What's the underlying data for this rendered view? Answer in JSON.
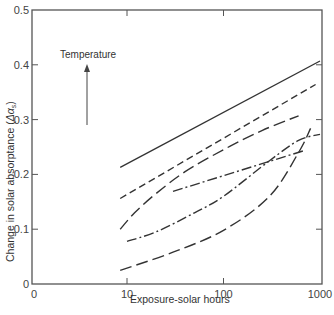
{
  "chart_data": {
    "type": "line",
    "title": "",
    "xlabel": "Exposure-solar hours",
    "ylabel": "Change in solar absorptance (Δαs)",
    "ylabel_main": "Change in solar absorptance (",
    "ylabel_symbol": "Δα",
    "ylabel_sub": "s",
    "ylabel_close": ")",
    "x_scale": "log",
    "xlim": [
      0,
      1000
    ],
    "ylim": [
      0,
      0.5
    ],
    "x_ticks": [
      {
        "value": 0,
        "label": "0"
      },
      {
        "value": 10,
        "label": "10"
      },
      {
        "value": 100,
        "label": "100"
      },
      {
        "value": 1000,
        "label": "1000"
      }
    ],
    "y_ticks": [
      {
        "value": 0,
        "label": "0"
      },
      {
        "value": 0.1,
        "label": "0.1"
      },
      {
        "value": 0.2,
        "label": "0.2"
      },
      {
        "value": 0.3,
        "label": "0.3"
      },
      {
        "value": 0.4,
        "label": "0.4"
      },
      {
        "value": 0.5,
        "label": "0.5"
      }
    ],
    "grid": false,
    "legend": null,
    "annotations": [
      {
        "text": "Temperature",
        "arrow": "up",
        "meaning": "increasing temperature direction"
      }
    ],
    "series": [
      {
        "name": "curve-1-solid",
        "style": "solid",
        "x": [
          8.5,
          1000
        ],
        "y": [
          0.213,
          0.407
        ]
      },
      {
        "name": "curve-2-short-dash",
        "style": "short-dash",
        "x": [
          8.5,
          900
        ],
        "y": [
          0.156,
          0.364
        ]
      },
      {
        "name": "curve-3-long-dash",
        "style": "long-dash",
        "x": [
          8.5,
          12,
          20,
          40,
          100,
          250,
          600
        ],
        "y": [
          0.1,
          0.13,
          0.165,
          0.205,
          0.245,
          0.28,
          0.307
        ]
      },
      {
        "name": "curve-4-dash-dot",
        "style": "dash-dot",
        "x": [
          10,
          20,
          50,
          100,
          300,
          600,
          1000
        ],
        "y": [
          0.078,
          0.095,
          0.13,
          0.16,
          0.225,
          0.262,
          0.273
        ]
      },
      {
        "name": "curve-5-dash-dot-short",
        "style": "dash-dot",
        "x": [
          30,
          700
        ],
        "y": [
          0.169,
          0.244
        ]
      },
      {
        "name": "curve-6-long-dash-bottom",
        "style": "long-dash",
        "x": [
          8.5,
          30,
          100,
          300,
          600,
          800
        ],
        "y": [
          0.025,
          0.058,
          0.098,
          0.16,
          0.24,
          0.284
        ]
      }
    ]
  },
  "annotation": {
    "temperature_label": "Temperature"
  }
}
